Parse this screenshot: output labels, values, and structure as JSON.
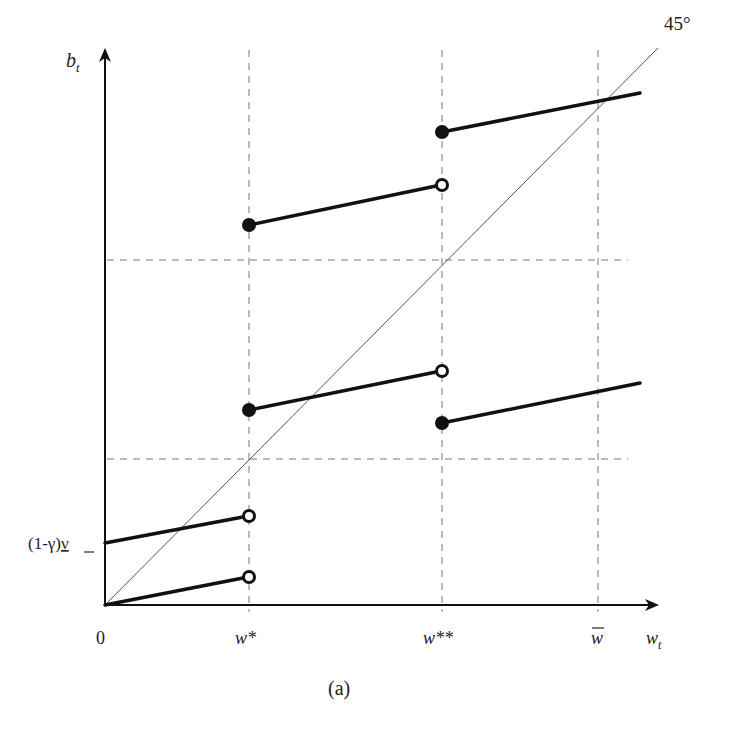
{
  "figure": {
    "caption": "(a)",
    "y_axis_label": "b",
    "y_axis_subscript": "t",
    "x_axis_label": "w",
    "x_axis_subscript": "t",
    "origin_label": "0",
    "angle_label": "45°",
    "y_intercept_label_prefix": "(1-γ)",
    "y_intercept_label_var": "ν",
    "x_ticks": [
      {
        "label": "w*",
        "x": 249
      },
      {
        "label": "w**",
        "x": 442
      },
      {
        "label": "w",
        "overbar": true,
        "x": 598
      }
    ],
    "dashed_horizontals_y": [
      260,
      459
    ],
    "segments": [
      {
        "from": [
          105,
          605
        ],
        "to": [
          249,
          577
        ],
        "start": "none",
        "end": "open"
      },
      {
        "from": [
          105,
          543
        ],
        "to": [
          249,
          516
        ],
        "start": "none",
        "end": "open"
      },
      {
        "from": [
          249,
          410
        ],
        "to": [
          442,
          371
        ],
        "start": "filled",
        "end": "open"
      },
      {
        "from": [
          249,
          225
        ],
        "to": [
          442,
          185
        ],
        "start": "filled",
        "end": "open"
      },
      {
        "from": [
          442,
          423
        ],
        "to": [
          640,
          383
        ],
        "start": "filled",
        "end": "none"
      },
      {
        "from": [
          442,
          132
        ],
        "to": [
          640,
          93
        ],
        "start": "filled",
        "end": "none"
      }
    ],
    "colors": {
      "ink": "#111111",
      "dash": "#777777",
      "diagonal": "#555555",
      "background": "#ffffff"
    }
  }
}
